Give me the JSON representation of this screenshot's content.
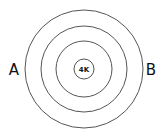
{
  "diagram": {
    "type": "concentric-circles",
    "center_label": "4K",
    "left_label": "A",
    "right_label": "B",
    "stroke_color": "#555555",
    "circles": [
      {
        "r": 59
      },
      {
        "r": 43
      },
      {
        "r": 28
      },
      {
        "r": 10
      }
    ]
  }
}
